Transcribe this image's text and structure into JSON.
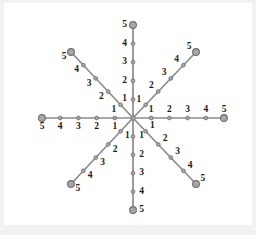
{
  "figure": {
    "title": "",
    "background_color": "#ffffff",
    "canvas_color": "#f2f2f2",
    "line_color": "#8c8c8c",
    "marker_fill": "#a8a8a8",
    "marker_stroke": "#6e6e6e",
    "label_color": "#1c1c1c",
    "center": {
      "x": 133,
      "y": 118
    }
  },
  "chart_data": {
    "type": "scatter",
    "title": "",
    "xlabel": "",
    "ylabel": "",
    "xlim": [
      -5,
      5
    ],
    "ylim": [
      -5,
      5
    ],
    "grid": false,
    "legend": null,
    "radial_tick_values": [
      1,
      2,
      3,
      4,
      5
    ],
    "radial_tick_labels": [
      "1",
      "2",
      "3",
      "4",
      "5"
    ],
    "endpoint_tick_value": 5,
    "series": [
      {
        "name": "ray-up",
        "angle_degrees": 90,
        "direction": "up",
        "label_side": "left",
        "values": [
          1,
          2,
          3,
          4,
          5
        ],
        "labels": [
          "1",
          "2",
          "3",
          "4",
          "5"
        ],
        "end_px": {
          "x": 133,
          "y": 25
        }
      },
      {
        "name": "ray-upper-right",
        "angle_degrees": 45,
        "direction": "upper-right",
        "label_side": "upper-left",
        "values": [
          1,
          2,
          3,
          4,
          5
        ],
        "labels": [
          "1",
          "2",
          "3",
          "4",
          "5"
        ],
        "end_px": {
          "x": 196,
          "y": 52
        }
      },
      {
        "name": "ray-right",
        "angle_degrees": 0,
        "direction": "right",
        "label_side": "above",
        "values": [
          1,
          2,
          3,
          4,
          5
        ],
        "labels": [
          "1",
          "2",
          "3",
          "4",
          "5"
        ],
        "end_px": {
          "x": 224,
          "y": 118
        }
      },
      {
        "name": "ray-lower-right",
        "angle_degrees": -45,
        "direction": "lower-right",
        "label_side": "upper-right",
        "values": [
          1,
          2,
          3,
          4,
          5
        ],
        "labels": [
          "1",
          "2",
          "3",
          "4",
          "5"
        ],
        "end_px": {
          "x": 196,
          "y": 184
        }
      },
      {
        "name": "ray-down",
        "angle_degrees": -90,
        "direction": "down",
        "label_side": "right",
        "values": [
          1,
          2,
          3,
          4,
          5
        ],
        "labels": [
          "1",
          "2",
          "3",
          "4",
          "5"
        ],
        "end_px": {
          "x": 133,
          "y": 210
        }
      },
      {
        "name": "ray-lower-left",
        "angle_degrees": -135,
        "direction": "lower-left",
        "label_side": "lower-right",
        "values": [
          1,
          2,
          3,
          4,
          5
        ],
        "labels": [
          "1",
          "2",
          "3",
          "4",
          "5"
        ],
        "end_px": {
          "x": 71,
          "y": 184
        }
      },
      {
        "name": "ray-left",
        "angle_degrees": 180,
        "direction": "left",
        "label_side": "below",
        "values": [
          1,
          2,
          3,
          4,
          5
        ],
        "labels": [
          "1",
          "2",
          "3",
          "4",
          "5"
        ],
        "end_px": {
          "x": 42,
          "y": 118
        }
      },
      {
        "name": "ray-upper-left",
        "angle_degrees": 135,
        "direction": "upper-left",
        "label_side": "lower-left",
        "values": [
          1,
          2,
          3,
          4,
          5
        ],
        "labels": [
          "1",
          "2",
          "3",
          "4",
          "5"
        ],
        "end_px": {
          "x": 71,
          "y": 52
        }
      }
    ]
  }
}
